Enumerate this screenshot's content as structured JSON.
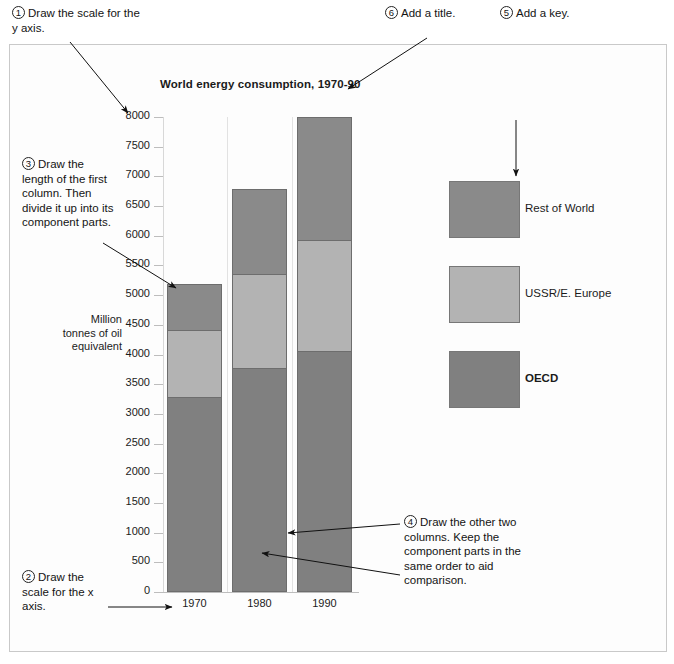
{
  "annotations": [
    {
      "id": "1",
      "num": "1",
      "text": "Draw the scale for the y axis."
    },
    {
      "id": "6",
      "num": "6",
      "text": "Add a title."
    },
    {
      "id": "5",
      "num": "5",
      "text": "Add a key."
    },
    {
      "id": "3",
      "num": "3",
      "text": "Draw the length of the first column. Then divide it up into its component parts."
    },
    {
      "id": "2",
      "num": "2",
      "text": "Draw the scale for the x axis."
    },
    {
      "id": "4",
      "num": "4",
      "text": "Draw the other two columns. Keep the component parts in the same order to aid comparison."
    }
  ],
  "legend": {
    "items": [
      {
        "label": "Rest of World",
        "color": "#8a8a8a",
        "bold": false
      },
      {
        "label": "USSR/E. Europe",
        "color": "#b3b3b3",
        "bold": false
      },
      {
        "label": "OECD",
        "color": "#808080",
        "bold": true
      }
    ]
  },
  "chart_data": {
    "type": "bar",
    "stacked": true,
    "title": "World energy consumption, 1970-90",
    "xlabel": "",
    "ylabel": "Million tonnes of oil equivalent",
    "categories": [
      "1970",
      "1980",
      "1990"
    ],
    "series": [
      {
        "name": "OECD",
        "color": "#808080",
        "values": [
          3280,
          3780,
          4060
        ]
      },
      {
        "name": "USSR/E. Europe",
        "color": "#b3b3b3",
        "values": [
          1130,
          1570,
          1870
        ]
      },
      {
        "name": "Rest of World",
        "color": "#8a8a8a",
        "values": [
          770,
          1430,
          2070
        ]
      }
    ],
    "totals": [
      5180,
      6780,
      8000
    ],
    "ylim": [
      0,
      8000
    ],
    "ytick_step": 500,
    "yticks": [
      "8000",
      "7500",
      "7000",
      "6500",
      "6000",
      "5500",
      "5000",
      "4500",
      "4000",
      "3500",
      "3000",
      "2500",
      "2000",
      "1500",
      "1000",
      "500",
      "0"
    ],
    "grid": false,
    "legend_position": "right"
  }
}
